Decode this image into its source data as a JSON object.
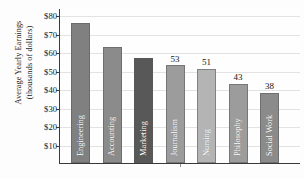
{
  "chart_data": {
    "type": "bar",
    "title": "",
    "xlabel": "",
    "ylabel": "Average Yearly Earnings (thousands of dollars)",
    "ylabel_line1": "Average Yearly Earnings",
    "ylabel_line2": "(thousands of dollars)",
    "ylim": [
      0,
      84
    ],
    "y_tick_values": [
      10,
      20,
      30,
      40,
      50,
      60,
      70,
      80
    ],
    "y_tick_labels": [
      "$10",
      "$20",
      "$30",
      "$40",
      "$50",
      "$60",
      "$70",
      "$80"
    ],
    "grid": true,
    "legend": "none",
    "value_label_precision": 0,
    "categories": [
      "Engineering",
      "Accounting",
      "Marketing",
      "Journalism",
      "Nursing",
      "Philosophy",
      "Social Work"
    ],
    "values": [
      76,
      63,
      57,
      53,
      51,
      43,
      38
    ],
    "bars": [
      {
        "category": "Engineering",
        "value": 76,
        "value_label": "",
        "color": "#808080",
        "label_color": "light"
      },
      {
        "category": "Accounting",
        "value": 63,
        "value_label": "",
        "color": "#8b8b8b",
        "label_color": "light"
      },
      {
        "category": "Marketing",
        "value": 57,
        "value_label": "",
        "color": "#585858",
        "label_color": "light"
      },
      {
        "category": "Journalism",
        "value": 53,
        "value_label": "53",
        "color": "#9c9c9c",
        "label_color": "light"
      },
      {
        "category": "Nursing",
        "value": 51,
        "value_label": "51",
        "color": "#b4b4b4",
        "label_color": "light"
      },
      {
        "category": "Philosophy",
        "value": 43,
        "value_label": "43",
        "color": "#9c9c9c",
        "label_color": "light"
      },
      {
        "category": "Social Work",
        "value": 38,
        "value_label": "38",
        "color": "#8b8b8b",
        "label_color": "light"
      }
    ],
    "colors": {
      "axis": "#3a3a3a",
      "grid": "#e3e3e3",
      "text": "#161616",
      "background": "#fdfdfd",
      "highlight_bar": "#585858"
    }
  }
}
